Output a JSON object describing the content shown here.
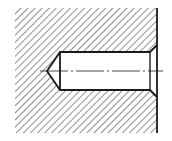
{
  "drawing": {
    "title": "Blind hole with countersink — sectional view",
    "colors": {
      "line": "#1a1a1a",
      "hatch": "#333333",
      "background": "#ffffff"
    },
    "hatch": {
      "x": 15,
      "y": 8,
      "width": 142,
      "height": 125,
      "spacing": 5,
      "angle_deg": 45
    },
    "hole": {
      "left": 60,
      "right": 150,
      "top": 52,
      "bottom": 90,
      "cone_tip_x": 47,
      "chamfer_x": 157,
      "chamfer_top": 45,
      "chamfer_bottom": 97
    },
    "centerline": {
      "y": 71,
      "x1": 40,
      "x2": 163
    },
    "edge": {
      "x": 157,
      "y1": 8,
      "y2": 133
    }
  }
}
